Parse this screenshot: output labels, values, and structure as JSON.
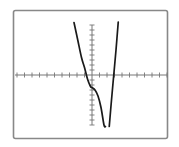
{
  "chart_data": {
    "type": "line",
    "title": "",
    "xlabel": "",
    "ylabel": "",
    "grid": false,
    "legend": null,
    "x_ticks_count": 20,
    "y_ticks_count": 20,
    "xlim": [
      -10,
      10
    ],
    "ylim": [
      -10,
      10
    ],
    "series": [
      {
        "name": "left-branch",
        "x": [
          -2.4,
          -1.9,
          -1.4,
          -1.0,
          -0.6,
          -0.2,
          0.0,
          0.4,
          0.8,
          1.2,
          1.6,
          1.8
        ],
        "y": [
          10.5,
          7.0,
          3.5,
          1.5,
          -0.8,
          -2.3,
          -2.5,
          -3.0,
          -4.2,
          -6.5,
          -10.0,
          -10.3
        ]
      },
      {
        "name": "right-branch",
        "x": [
          2.3,
          2.6,
          2.9,
          3.2,
          3.5
        ],
        "y": [
          -10.3,
          -5.0,
          0.0,
          5.0,
          10.6
        ]
      }
    ]
  },
  "colors": {
    "frame": "#888888",
    "axis": "#777777",
    "curve": "#1a1a1a",
    "background": "#ffffff"
  }
}
